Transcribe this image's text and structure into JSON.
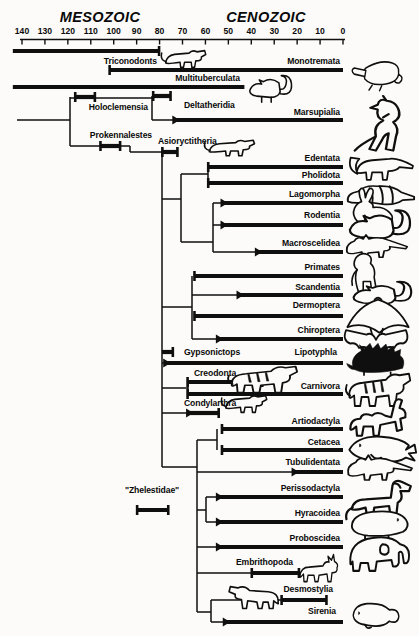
{
  "eras": {
    "left": "MESOZOIC",
    "right": "CENOZOIC"
  },
  "axis": {
    "ticks": [
      140,
      130,
      120,
      110,
      100,
      90,
      80,
      70,
      60,
      50,
      40,
      30,
      20,
      10,
      0
    ]
  },
  "taxa": [
    {
      "id": "triconodonts",
      "label": "Triconodonts",
      "from_ma": 144,
      "to_ma": 80,
      "icon": "triconodont-icon"
    },
    {
      "id": "monotremata",
      "label": "Monotremata",
      "from_ma": 102,
      "to_ma": 0,
      "icon": "platypus-icon"
    },
    {
      "id": "multituberculata",
      "label": "Multituberculata",
      "from_ma": 144,
      "to_ma": 43,
      "icon": "multituberculate-icon"
    },
    {
      "id": "holoclemensia",
      "label": "Holoclemensia",
      "from_ma": 117,
      "to_ma": 108
    },
    {
      "id": "deltatheridia",
      "label": "Deltatheridia",
      "from_ma": 83,
      "to_ma": 75
    },
    {
      "id": "marsupialia",
      "label": "Marsupialia",
      "from_ma": 74,
      "to_ma": 0,
      "icon": "kangaroo-icon"
    },
    {
      "id": "prokennalestes",
      "label": "Prokennalestes",
      "from_ma": 106,
      "to_ma": 97
    },
    {
      "id": "asioryctitheria",
      "label": "Asioryctitheria",
      "from_ma": 79,
      "to_ma": 72,
      "icon": "asioryctithere-icon"
    },
    {
      "id": "edentata",
      "label": "Edentata",
      "from_ma": 59,
      "to_ma": 0,
      "icon": "anteater-icon"
    },
    {
      "id": "pholidota",
      "label": "Pholidota",
      "from_ma": 59,
      "to_ma": 0,
      "icon": "pangolin-icon"
    },
    {
      "id": "lagomorpha",
      "label": "Lagomorpha",
      "from_ma": 53,
      "to_ma": 0,
      "icon": "rabbit-icon"
    },
    {
      "id": "rodentia",
      "label": "Rodentia",
      "from_ma": 53,
      "to_ma": 0,
      "icon": "rodent-icon"
    },
    {
      "id": "macroscelidea",
      "label": "Macroscelidea",
      "from_ma": 38,
      "to_ma": 0,
      "icon": "elephant-shrew-icon"
    },
    {
      "id": "primates",
      "label": "Primates",
      "from_ma": 65,
      "to_ma": 0,
      "icon": "gorilla-icon"
    },
    {
      "id": "scandentia",
      "label": "Scandentia",
      "from_ma": 46,
      "to_ma": 0,
      "icon": "tree-shrew-icon"
    },
    {
      "id": "dermoptera",
      "label": "Dermoptera",
      "from_ma": 65,
      "to_ma": 0,
      "icon": "colugo-icon"
    },
    {
      "id": "chiroptera",
      "label": "Chiroptera",
      "from_ma": 55,
      "to_ma": 0,
      "icon": "bat-icon"
    },
    {
      "id": "gypsonictops",
      "label": "Gypsonictops",
      "from_ma": 79,
      "to_ma": 74
    },
    {
      "id": "lipotyphla",
      "label": "Lipotyphla",
      "from_ma": 78,
      "to_ma": 0,
      "icon": "hedgehog-icon"
    },
    {
      "id": "creodonta",
      "label": "Creodonta",
      "from_ma": 68,
      "to_ma": 35,
      "icon": "creodont-icon"
    },
    {
      "id": "carnivora",
      "label": "Carnivora",
      "from_ma": 68,
      "to_ma": 0,
      "icon": "tiger-icon"
    },
    {
      "id": "condylarthra",
      "label": "Condylarthra",
      "from_ma": 68,
      "to_ma": 54,
      "icon": "condylarth-icon"
    },
    {
      "id": "artiodactyla",
      "label": "Artiodactyla",
      "from_ma": 53,
      "to_ma": 0,
      "icon": "camel-icon"
    },
    {
      "id": "cetacea",
      "label": "Cetacea",
      "from_ma": 53,
      "to_ma": 0,
      "icon": "whale-icon"
    },
    {
      "id": "tubulidentata",
      "label": "Tubulidentata",
      "from_ma": 22,
      "to_ma": 0,
      "icon": "aardvark-icon"
    },
    {
      "id": "zhelestidae",
      "label": "\"Zhelestidae\"",
      "from_ma": 90,
      "to_ma": 76
    },
    {
      "id": "perissodactyla",
      "label": "Perissodactyla",
      "from_ma": 55,
      "to_ma": 0,
      "icon": "horse-icon"
    },
    {
      "id": "hyracoidea",
      "label": "Hyracoidea",
      "from_ma": 55,
      "to_ma": 0,
      "icon": "hyrax-icon"
    },
    {
      "id": "proboscidea",
      "label": "Proboscidea",
      "from_ma": 55,
      "to_ma": 0,
      "icon": "elephant-icon"
    },
    {
      "id": "embrithopoda",
      "label": "Embrithopoda",
      "from_ma": 40,
      "to_ma": 19,
      "icon": "arsinoitherium-icon"
    },
    {
      "id": "desmostylia",
      "label": "Desmostylia",
      "from_ma": 27,
      "to_ma": 7,
      "icon": "desmostylian-icon"
    },
    {
      "id": "sirenia",
      "label": "Sirenia",
      "from_ma": 52,
      "to_ma": 0,
      "icon": "manatee-icon"
    }
  ]
}
